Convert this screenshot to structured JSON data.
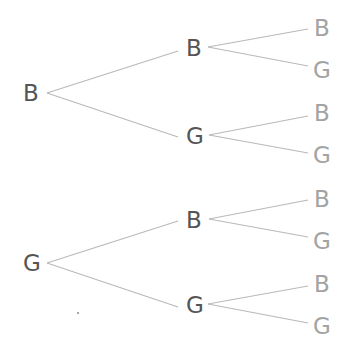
{
  "diagram": {
    "type": "probability-tree",
    "colors": {
      "inner_label": "#555555",
      "leaf_label": "#a3a3a3",
      "edge": "#b9b9b9"
    },
    "nodes": [
      {
        "id": "r1",
        "label": "B",
        "level": 0,
        "x": 31,
        "y": 93
      },
      {
        "id": "r1b",
        "label": "B",
        "level": 1,
        "x": 194,
        "y": 48
      },
      {
        "id": "r1g",
        "label": "G",
        "level": 1,
        "x": 195,
        "y": 136
      },
      {
        "id": "r1b_b",
        "label": "B",
        "level": 2,
        "x": 322,
        "y": 28
      },
      {
        "id": "r1b_g",
        "label": "G",
        "level": 2,
        "x": 322,
        "y": 70
      },
      {
        "id": "r1g_b",
        "label": "B",
        "level": 2,
        "x": 322,
        "y": 113
      },
      {
        "id": "r1g_g",
        "label": "G",
        "level": 2,
        "x": 322,
        "y": 155
      },
      {
        "id": "r2",
        "label": "G",
        "level": 0,
        "x": 32,
        "y": 263
      },
      {
        "id": "r2b",
        "label": "B",
        "level": 1,
        "x": 194,
        "y": 220
      },
      {
        "id": "r2g",
        "label": "G",
        "level": 1,
        "x": 195,
        "y": 305
      },
      {
        "id": "r2b_b",
        "label": "B",
        "level": 2,
        "x": 322,
        "y": 199
      },
      {
        "id": "r2b_g",
        "label": "G",
        "level": 2,
        "x": 322,
        "y": 241
      },
      {
        "id": "r2g_b",
        "label": "B",
        "level": 2,
        "x": 322,
        "y": 284
      },
      {
        "id": "r2g_g",
        "label": "G",
        "level": 2,
        "x": 322,
        "y": 326
      }
    ],
    "edges": [
      {
        "from": "r1",
        "to": "r1b",
        "x1": 47,
        "y1": 93,
        "x2": 178,
        "y2": 51
      },
      {
        "from": "r1",
        "to": "r1g",
        "x1": 47,
        "y1": 93,
        "x2": 178,
        "y2": 137
      },
      {
        "from": "r1b",
        "to": "r1b_b",
        "x1": 208,
        "y1": 47,
        "x2": 308,
        "y2": 29
      },
      {
        "from": "r1b",
        "to": "r1b_g",
        "x1": 208,
        "y1": 47,
        "x2": 308,
        "y2": 66
      },
      {
        "from": "r1g",
        "to": "r1g_b",
        "x1": 209,
        "y1": 135,
        "x2": 308,
        "y2": 116
      },
      {
        "from": "r1g",
        "to": "r1g_g",
        "x1": 209,
        "y1": 135,
        "x2": 308,
        "y2": 153
      },
      {
        "from": "r2",
        "to": "r2b",
        "x1": 47,
        "y1": 263,
        "x2": 178,
        "y2": 221
      },
      {
        "from": "r2",
        "to": "r2g",
        "x1": 47,
        "y1": 263,
        "x2": 178,
        "y2": 307
      },
      {
        "from": "r2b",
        "to": "r2b_b",
        "x1": 209,
        "y1": 219,
        "x2": 308,
        "y2": 200
      },
      {
        "from": "r2b",
        "to": "r2b_g",
        "x1": 209,
        "y1": 219,
        "x2": 308,
        "y2": 237
      },
      {
        "from": "r2g",
        "to": "r2g_b",
        "x1": 208,
        "y1": 304,
        "x2": 308,
        "y2": 286
      },
      {
        "from": "r2g",
        "to": "r2g_g",
        "x1": 208,
        "y1": 304,
        "x2": 308,
        "y2": 323
      }
    ]
  }
}
